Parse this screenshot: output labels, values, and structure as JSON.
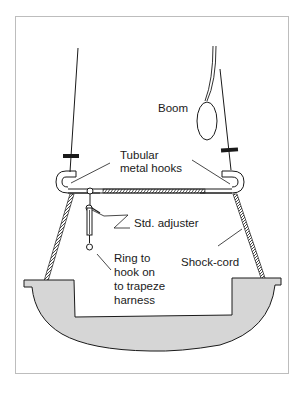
{
  "diagram": {
    "type": "labelled technical illustration",
    "colors": {
      "frame_border": "#bdbdbd",
      "line": "#1a1a1a",
      "hull_fill": "#d6d6d6",
      "background": "#ffffff"
    },
    "labels": {
      "boom": "Boom",
      "hooks_line1": "Tubular",
      "hooks_line2": "metal hooks",
      "adjuster": "Std. adjuster",
      "ring_line1": "Ring to",
      "ring_line2": "hook on",
      "ring_line3": "to trapeze",
      "ring_line4": "harness",
      "shock_cord": "Shock-cord"
    }
  }
}
